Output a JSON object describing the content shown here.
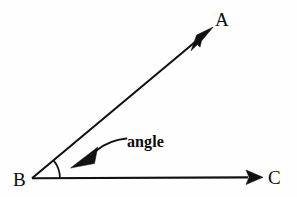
{
  "figure": {
    "title": "angle",
    "background_color": "#fefefe",
    "stroke_color": "#111111",
    "width": 297,
    "height": 197,
    "labels": {
      "point_a": "A",
      "point_b": "B",
      "point_c": "C",
      "annotation": "angle"
    },
    "geometry": {
      "vertex": {
        "x": 32,
        "y": 178
      },
      "ray_ba": {
        "from_x": 32,
        "from_y": 178,
        "to_x": 213,
        "to_y": 27,
        "degrees": 39.8
      },
      "ray_bc": {
        "from_x": 32,
        "from_y": 178,
        "to_x": 263,
        "to_y": 177,
        "degrees": 0
      },
      "arc_radius": 28,
      "arc_start_degrees": 0,
      "arc_end_degrees": 40,
      "leader_tip": {
        "x": 70,
        "y": 168
      }
    },
    "label_positions": {
      "a": {
        "x": 215,
        "y": 26
      },
      "b": {
        "x": 13,
        "y": 186
      },
      "c": {
        "x": 268,
        "y": 184
      },
      "annotation": {
        "x": 127,
        "y": 147
      }
    }
  }
}
